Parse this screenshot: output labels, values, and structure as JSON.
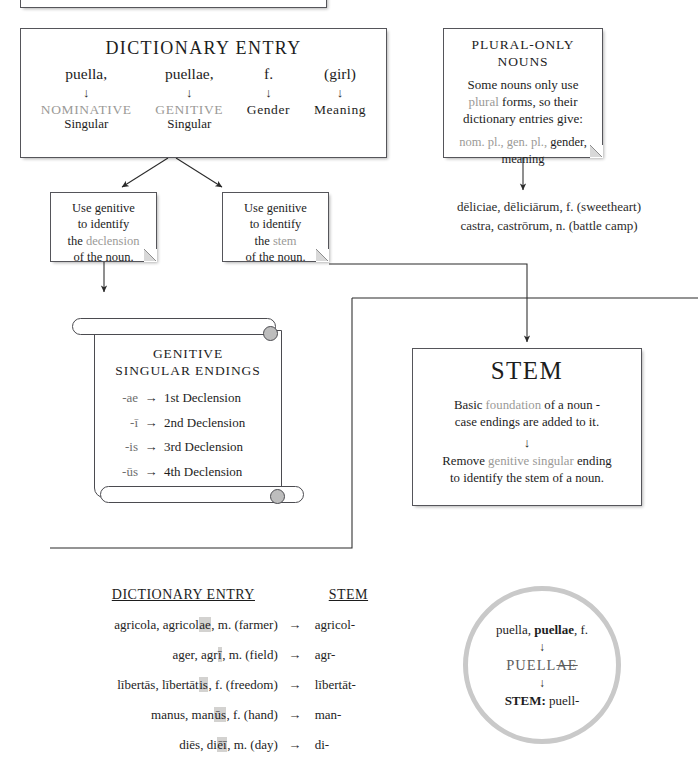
{
  "clipped_top_box": {
    "note": "partially visible box above the fold"
  },
  "dictionary_entry": {
    "title": "DICTIONARY ENTRY",
    "arrow_glyph": "↓",
    "columns": [
      {
        "word": "puella,",
        "case_label": "NOMINATIVE",
        "number_label": "Singular",
        "muted": true
      },
      {
        "word": "puellae,",
        "case_label": "GENITIVE",
        "number_label": "Singular",
        "muted": true
      },
      {
        "word": "f.",
        "case_label": "Gender",
        "number_label": "",
        "muted": false
      },
      {
        "word": "(girl)",
        "case_label": "Meaning",
        "number_label": "",
        "muted": false
      }
    ]
  },
  "plural_only": {
    "title_line1": "PLURAL-ONLY",
    "title_line2": "NOUNS",
    "body_part1": "Some nouns only use",
    "body_highlight": "plural",
    "body_part2": "forms, so their",
    "body_part3": "dictionary entries give:",
    "gives_muted": "nom. pl., gen. pl.,",
    "gives_plain": "gender,",
    "gives_line2": "meaning",
    "examples": [
      "dēliciae, dēliciārum, f.  (sweetheart)",
      "castra, castrōrum, n. (battle camp)"
    ]
  },
  "notes": {
    "declension": {
      "line1": "Use genitive",
      "line2": "to identify",
      "line3_pre": "the ",
      "line3_hl": "declension",
      "line4": "of the noun."
    },
    "stem": {
      "line1": "Use genitive",
      "line2": "to identify",
      "line3_pre": "the ",
      "line3_hl": "stem",
      "line4": "of the noun."
    }
  },
  "scroll": {
    "title_line1": "GENITIVE",
    "title_line2": "SINGULAR ENDINGS",
    "arrow_glyph": "→",
    "endings": [
      {
        "ending": "-ae",
        "declension": "1st Declension"
      },
      {
        "ending": "-ī",
        "declension": "2nd Declension"
      },
      {
        "ending": "-is",
        "declension": "3rd Declension"
      },
      {
        "ending": "-ūs",
        "declension": "4th Declension"
      },
      {
        "ending": "-eī",
        "declension": "5th Declension"
      }
    ]
  },
  "stem_box": {
    "title": "STEM",
    "body_pre": "Basic ",
    "body_hl": "foundation",
    "body_post": " of a noun -",
    "body_line2": "case endings are added to it.",
    "arrow_glyph": "↓",
    "remove_pre": "Remove ",
    "remove_hl": "genitive singular",
    "remove_post": " ending",
    "remove_line2": "to identify the stem of a noun."
  },
  "table": {
    "header_entry": "DICTIONARY ENTRY",
    "header_stem": "STEM",
    "arrow_glyph": "→",
    "rows": [
      {
        "pre": "agricola, agricol",
        "hl": "ae",
        "post": ", m.  (farmer)",
        "stem": "agricol-"
      },
      {
        "pre": "ager, agr",
        "hl": "ī",
        "post": ", m.  (field)",
        "stem": "agr-"
      },
      {
        "pre": "lībertās, lībertāt",
        "hl": "is",
        "post": ", f.  (freedom)",
        "stem": "lībertāt-"
      },
      {
        "pre": "manus, man",
        "hl": "ūs",
        "post": ", f.  (hand)",
        "stem": "man-"
      },
      {
        "pre": "diēs, di",
        "hl": "ēī",
        "post": ", m.  (day)",
        "stem": "di-"
      }
    ]
  },
  "circle": {
    "line1_plain": "puella, ",
    "line1_bold": "puellae",
    "line1_tail": ", f.",
    "arrow_glyph": "↓",
    "line2_keep": "PUELL",
    "line2_strike": "AE",
    "line3_label": "STEM:",
    "line3_value": "puell-"
  },
  "colors": {
    "muted_text": "#9b9a97",
    "box_border": "#55555a",
    "highlight_bg": "#d3d2d0",
    "circle_ring": "#c9c9c9"
  }
}
